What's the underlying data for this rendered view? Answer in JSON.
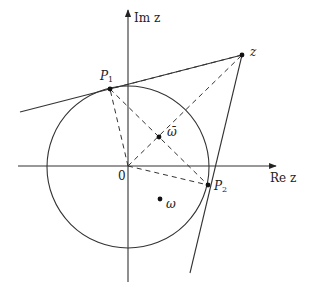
{
  "diagram": {
    "type": "complex-plane-geometry",
    "axes": {
      "real_label": "Re z",
      "imag_label": "Im z",
      "origin_label": "0"
    },
    "circle": {
      "center": "0",
      "description": "unit circle centered at origin"
    },
    "points": [
      {
        "id": "z",
        "label": "z"
      },
      {
        "id": "P1",
        "label": "P",
        "sub": "1"
      },
      {
        "id": "P2",
        "label": "P",
        "sub": "2"
      },
      {
        "id": "omega_bar",
        "label": "ω̄"
      },
      {
        "id": "omega",
        "label": "ω"
      }
    ],
    "lines": [
      {
        "from": "z",
        "to": "P1",
        "style": "solid",
        "role": "tangent line"
      },
      {
        "from": "z",
        "to": "P2",
        "style": "solid",
        "role": "tangent line"
      },
      {
        "from": "0",
        "to": "z",
        "style": "dashed"
      },
      {
        "from": "0",
        "to": "P1",
        "style": "dashed"
      },
      {
        "from": "0",
        "to": "P2",
        "style": "dashed"
      },
      {
        "from": "P1",
        "to": "P2",
        "style": "dashed"
      },
      {
        "from": "z",
        "to": "P1",
        "style": "dashed-chord"
      }
    ],
    "colors": {
      "stroke": "#333333",
      "background": "#ffffff"
    }
  }
}
